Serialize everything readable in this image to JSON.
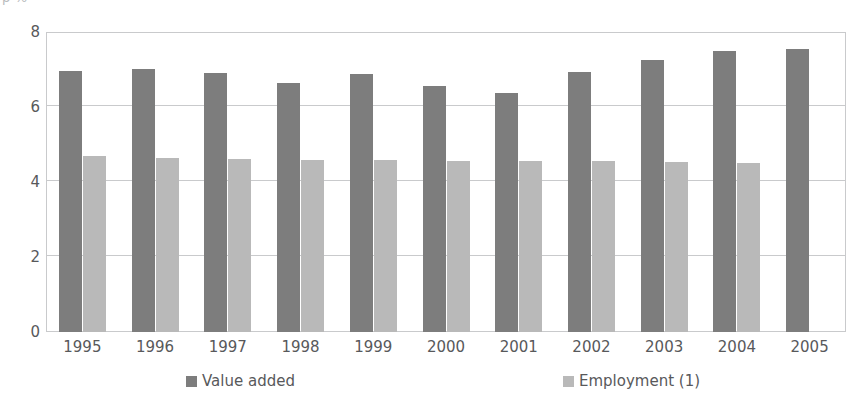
{
  "top_caption_partial": "p                                                                                   %",
  "chart_data": {
    "type": "bar",
    "title": "",
    "subtitle": "",
    "xlabel": "",
    "ylabel": "",
    "ylim": [
      0,
      8
    ],
    "yticks": [
      0,
      2,
      4,
      6,
      8
    ],
    "ytick_labels": [
      "0",
      "2",
      "4",
      "6",
      "8"
    ],
    "grid": true,
    "legend_position": "bottom",
    "categories": [
      "1995",
      "1996",
      "1997",
      "1998",
      "1999",
      "2000",
      "2001",
      "2002",
      "2003",
      "2004",
      "2005"
    ],
    "series": [
      {
        "name": "Value added",
        "color": "#7d7d7d",
        "values": [
          6.95,
          7.02,
          6.9,
          6.63,
          6.88,
          6.55,
          6.38,
          6.93,
          7.26,
          7.5,
          7.55
        ]
      },
      {
        "name": "Employment (1)",
        "color": "#b9b9b9",
        "values": [
          4.7,
          4.64,
          4.62,
          4.59,
          4.6,
          4.55,
          4.55,
          4.56,
          4.53,
          4.5,
          null
        ]
      }
    ]
  },
  "legend": {
    "items": [
      {
        "label": "Value added",
        "color": "#7d7d7d"
      },
      {
        "label": "Employment (1)",
        "color": "#b9b9b9"
      }
    ]
  },
  "colors": {
    "value_added": "#7d7d7d",
    "employment": "#b9b9b9",
    "axis": "#c9cacc",
    "text": "#58595b",
    "background": "#ffffff"
  }
}
